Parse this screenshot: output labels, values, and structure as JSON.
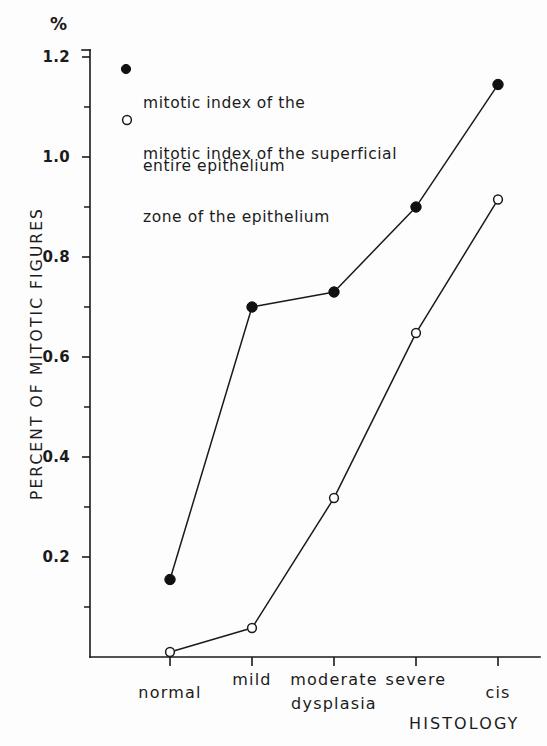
{
  "figure": {
    "unit_label": "%",
    "y_axis_title": "PERCENT OF MITOTIC FIGURES",
    "x_axis_title": "HISTOLOGY"
  },
  "legend": {
    "entries": [
      {
        "marker": "filled-circle",
        "line1": "mitotic index of the",
        "line2": "entire epithelium"
      },
      {
        "marker": "open-circle",
        "line1": "mitotic index of the superficial",
        "line2": "zone of the epithelium"
      }
    ]
  },
  "axes": {
    "y_ticks": [
      "1.2",
      "1.0",
      "0.8",
      "0.6",
      "0.4",
      "0.2"
    ],
    "x_ticks": [
      "normal",
      "mild",
      "moderate",
      "dysplasia",
      "severe",
      "cis"
    ]
  },
  "chart_data": {
    "type": "line",
    "title": "",
    "xlabel": "HISTOLOGY",
    "ylabel": "PERCENT OF MITOTIC FIGURES",
    "yunit": "%",
    "categories": [
      "normal",
      "mild",
      "moderate dysplasia",
      "severe",
      "cis"
    ],
    "ylim": [
      0.0,
      1.2
    ],
    "ytick_values": [
      0.2,
      0.4,
      0.6,
      0.8,
      1.0,
      1.2
    ],
    "yminor_ticks": [
      0.1,
      0.3,
      0.5,
      0.7,
      0.9,
      1.1
    ],
    "grid": false,
    "legend_position": "upper-left-inside",
    "series": [
      {
        "name": "mitotic index of the entire epithelium",
        "marker": "filled-circle",
        "values": [
          0.155,
          0.7,
          0.73,
          0.9,
          1.145
        ]
      },
      {
        "name": "mitotic index of the superficial zone of the epithelium",
        "marker": "open-circle",
        "values": [
          0.01,
          0.058,
          0.318,
          0.648,
          0.915
        ]
      }
    ]
  }
}
